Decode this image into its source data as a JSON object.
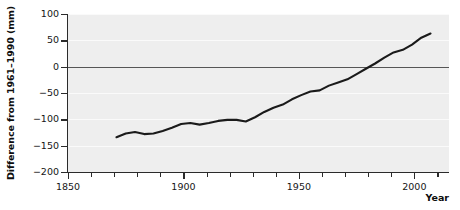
{
  "chart_data": {
    "type": "line",
    "title": "",
    "subtitle": "",
    "xlabel": "Year",
    "ylabel": "Difference from 1961–1990 (mm)",
    "xlim": [
      1850,
      2015
    ],
    "ylim": [
      -200,
      100
    ],
    "grid": true,
    "legend": "none",
    "plot_background": "#eeeeee",
    "gridline_color": "#fafafa",
    "zero_line_color": "#555555",
    "series_color": "#1a1a1a",
    "x_major_ticks": [
      1850,
      1900,
      1950,
      2000
    ],
    "x_major_tick_labels": [
      "1850",
      "1900",
      "1950",
      "2000"
    ],
    "x_minor_tick_step": 10,
    "x_minor_ticks": [
      1860,
      1870,
      1880,
      1890,
      1910,
      1920,
      1930,
      1940,
      1960,
      1970,
      1980,
      1990,
      2010
    ],
    "y_ticks": [
      100,
      50,
      0,
      -50,
      -100,
      -150,
      -200
    ],
    "y_tick_labels": [
      "100",
      "50",
      "0",
      "−50",
      "−100",
      "−150",
      "−200"
    ],
    "series": [
      {
        "name": "Difference from 1961-1990 mean",
        "x": [
          1871,
          1875,
          1879,
          1883,
          1887,
          1891,
          1895,
          1899,
          1903,
          1907,
          1911,
          1915,
          1919,
          1923,
          1927,
          1931,
          1935,
          1939,
          1943,
          1947,
          1951,
          1955,
          1959,
          1963,
          1967,
          1971,
          1975,
          1979,
          1983,
          1987,
          1991,
          1995,
          1999,
          2003,
          2007
        ],
        "values": [
          -134,
          -127,
          -124,
          -128,
          -127,
          -122,
          -116,
          -109,
          -107,
          -110,
          -107,
          -103,
          -101,
          -101,
          -104,
          -96,
          -86,
          -78,
          -72,
          -62,
          -54,
          -47,
          -45,
          -36,
          -30,
          -24,
          -14,
          -4,
          6,
          17,
          27,
          32,
          42,
          55,
          63
        ]
      }
    ]
  },
  "axes": {
    "y_title": "Difference from 1961–1990 (mm)",
    "x_title": "Year"
  }
}
